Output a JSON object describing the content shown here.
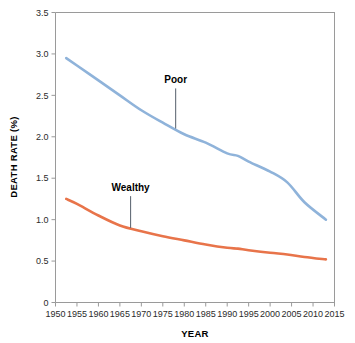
{
  "chart_data": {
    "type": "line",
    "title": "",
    "xlabel": "YEAR",
    "ylabel": "DEATH RATE (%)",
    "xlim": [
      1950,
      2015
    ],
    "ylim": [
      0,
      3.5
    ],
    "grid": false,
    "legend_position": "inline-annotations",
    "xticks": [
      "1950",
      "1955",
      "1960",
      "1965",
      "1970",
      "1975",
      "1980",
      "1985",
      "1990",
      "1995",
      "2000",
      "2005",
      "2010",
      "2015"
    ],
    "yticks": [
      "0",
      "0.5",
      "1.0",
      "1.5",
      "2.0",
      "2.5",
      "3.0",
      "3.5"
    ],
    "x": [
      1952.5,
      1955,
      1960,
      1965,
      1970,
      1975,
      1980,
      1985,
      1990,
      1992.5,
      1995,
      2000,
      2004,
      2008,
      2013
    ],
    "series": [
      {
        "name": "Poor",
        "color": "#8FB3DA",
        "values": [
          2.95,
          2.86,
          2.68,
          2.5,
          2.32,
          2.17,
          2.03,
          1.93,
          1.8,
          1.77,
          1.7,
          1.58,
          1.45,
          1.21,
          1.0
        ]
      },
      {
        "name": "Wealthy",
        "color": "#E8744A",
        "values": [
          1.25,
          1.19,
          1.05,
          0.93,
          0.86,
          0.8,
          0.75,
          0.7,
          0.66,
          0.65,
          0.63,
          0.6,
          0.58,
          0.55,
          0.52
        ]
      }
    ],
    "annotations": [
      {
        "text": "Poor",
        "x": 1978,
        "y": 2.62,
        "leader_to_y": 2.1
      },
      {
        "text": "Wealthy",
        "x": 1967.5,
        "y": 1.32,
        "leader_to_y": 0.9
      }
    ]
  },
  "colors": {
    "poor": "#8FB3DA",
    "wealthy": "#E8744A",
    "axis": "#9a9a9a",
    "text": "#2b2b2b",
    "background": "#ffffff"
  }
}
